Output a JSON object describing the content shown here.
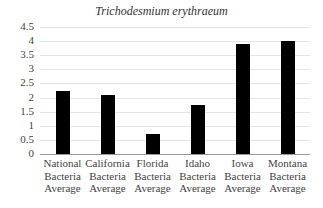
{
  "chart_data": {
    "type": "bar",
    "title": "Trichodesmium erythraeum",
    "xlabel": "",
    "ylabel": "",
    "ylim": [
      0,
      4.5
    ],
    "yticks": [
      "0",
      "0.5",
      "1",
      "1.5",
      "2",
      "2.5",
      "3",
      "3.5",
      "4",
      "4.5"
    ],
    "grid": true,
    "legend": null,
    "categories": [
      [
        "National",
        "Bacteria",
        "Average"
      ],
      [
        "California",
        "Bacteria",
        "Average"
      ],
      [
        "Florida",
        "Bacteria",
        "Average"
      ],
      [
        "Idaho",
        "Bacteria",
        "Average"
      ],
      [
        "Iowa",
        "Bacteria",
        "Average"
      ],
      [
        "Montana",
        "Bacteria",
        "Average"
      ]
    ],
    "category_names": [
      "National Bacteria Average",
      "California Bacteria Average",
      "Florida Bacteria Average",
      "Idaho Bacteria Average",
      "Iowa Bacteria Average",
      "Montana Bacteria Average"
    ],
    "values": [
      2.25,
      2.1,
      0.7,
      1.75,
      3.9,
      4.0
    ],
    "bar_color": "#000000"
  }
}
